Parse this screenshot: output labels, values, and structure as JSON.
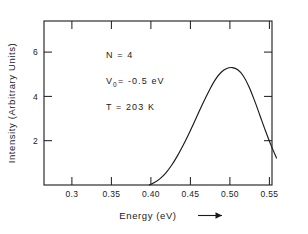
{
  "chart_data": {
    "type": "line",
    "title": "",
    "xlabel": "Energy (eV)",
    "xlabel_arrow": "→",
    "ylabel": "Intensity (Arbitrary Units)",
    "xlim": [
      0.275,
      0.585
    ],
    "ylim": [
      0,
      7.4
    ],
    "grid": false,
    "legend": null,
    "xticks": [
      0.3,
      0.35,
      0.4,
      0.45,
      0.5,
      0.55
    ],
    "xtick_labels": [
      "0.3",
      "0.35",
      "0.40",
      "0.45",
      "0.50",
      "0.55"
    ],
    "yticks": [
      2,
      4,
      6
    ],
    "ytick_labels": [
      "2",
      "4",
      "6"
    ],
    "series": [
      {
        "name": "intensity",
        "x": [
          0.398,
          0.405,
          0.412,
          0.419,
          0.426,
          0.433,
          0.44,
          0.447,
          0.454,
          0.461,
          0.468,
          0.475,
          0.482,
          0.489,
          0.496,
          0.503,
          0.51,
          0.517,
          0.524,
          0.531,
          0.538,
          0.545,
          0.552,
          0.559
        ],
        "y": [
          0.0,
          0.12,
          0.3,
          0.55,
          0.88,
          1.28,
          1.74,
          2.24,
          2.77,
          3.32,
          3.85,
          4.35,
          4.78,
          5.09,
          5.26,
          5.3,
          5.2,
          4.92,
          4.45,
          3.83,
          3.14,
          2.45,
          1.8,
          1.22
        ]
      }
    ],
    "annotations": [
      {
        "id": "n-value",
        "text": "N  =  4",
        "x": 0.345,
        "y": 6.55
      },
      {
        "id": "v0-value",
        "text": "V",
        "sub": "0",
        "rest": " = -0.5  eV",
        "x": 0.345,
        "y": 5.75
      },
      {
        "id": "t-value",
        "text": "T  =  203  K",
        "x": 0.345,
        "y": 4.95
      }
    ],
    "peak": {
      "x": 0.505,
      "y": 5.3
    },
    "colors": {
      "ink": "#1a1a1a",
      "background": "#ffffff"
    }
  }
}
